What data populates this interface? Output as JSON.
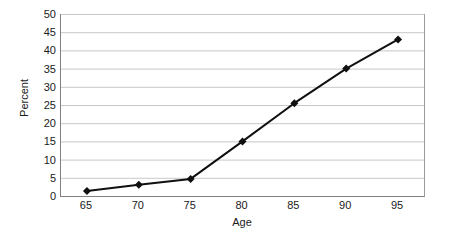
{
  "chart_data": {
    "type": "line",
    "title": "",
    "subtitle": "",
    "xlabel": "Age",
    "ylabel": "Percent",
    "categories": [
      "65",
      "70",
      "75",
      "80",
      "85",
      "90",
      "95"
    ],
    "values": [
      1.4,
      3.1,
      4.7,
      15.0,
      25.5,
      35.0,
      43.0
    ],
    "series": [
      {
        "name": "",
        "values": [
          1.4,
          3.1,
          4.7,
          15.0,
          25.5,
          35.0,
          43.0
        ]
      }
    ],
    "ylim": [
      0,
      50
    ],
    "ytick_step": 5,
    "ytick_labels": [
      "0",
      "5",
      "10",
      "15",
      "20",
      "25",
      "30",
      "35",
      "40",
      "45",
      "50"
    ],
    "xtick_labels": [
      "65",
      "70",
      "75",
      "80",
      "85",
      "90",
      "95"
    ],
    "grid": {
      "horizontal": true,
      "vertical": false,
      "color": "#c8c8c8"
    },
    "legend": {
      "visible": false,
      "position": "none",
      "entries": []
    },
    "style": {
      "line_color": "#101010",
      "line_width": 2,
      "marker": "diamond",
      "marker_color": "#101010",
      "marker_size": 7,
      "axis_color": "#808080",
      "background": "#ffffff",
      "text_color": "#1a1a1a"
    }
  }
}
